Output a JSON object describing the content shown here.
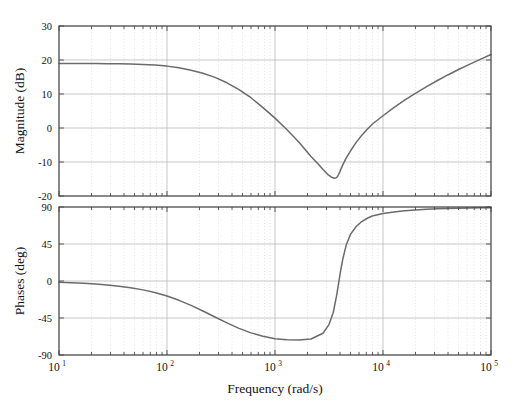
{
  "figure": {
    "title": "",
    "background_color": "#ffffff",
    "curve_color": "#6b6b6b",
    "frame_color": "#4a4a4a",
    "major_grid_color": "#b9b9b9",
    "minor_grid_color": "#d8d8d8"
  },
  "chart_data": [
    {
      "type": "line",
      "title": "",
      "panel": "magnitude",
      "xlabel": "Frequency (rad/s)",
      "ylabel": "Magnitude (dB)",
      "xscale": "log",
      "xlim": [
        10,
        100000
      ],
      "ylim": [
        -20,
        30
      ],
      "xticks": [
        10,
        100,
        1000,
        10000,
        100000
      ],
      "xticklabels": [
        "10^1",
        "10^2",
        "10^3",
        "10^4",
        "10^5"
      ],
      "yticks": [
        -20,
        -10,
        0,
        10,
        20,
        30
      ],
      "yticklabels": [
        "-20",
        "-10",
        "0",
        "10",
        "20",
        "30"
      ],
      "grid": true,
      "minor_grid": true,
      "legend": null,
      "series": [
        {
          "name": "Magnitude",
          "x": [
            10,
            13,
            17,
            22,
            28,
            36,
            46,
            60,
            77,
            100,
            129,
            167,
            215,
            278,
            359,
            464,
            599,
            774,
            1000,
            1292,
            1668,
            2154,
            2512,
            2783,
            3090,
            3311,
            3548,
            3715,
            3802,
            3890,
            3981,
            4074,
            4266,
            4571,
            5012,
            5623,
            6310,
            7079,
            7943,
            10000,
            12589,
            15849,
            19953,
            25119,
            31623,
            39811,
            50119,
            63096,
            79433,
            100000
          ],
          "y": [
            19.0,
            19.0,
            19.0,
            19.0,
            18.9,
            18.9,
            18.8,
            18.7,
            18.5,
            18.2,
            17.7,
            17.0,
            16.1,
            14.9,
            13.3,
            11.3,
            8.9,
            6.0,
            2.9,
            -0.5,
            -4.2,
            -8.4,
            -10.6,
            -12.2,
            -13.7,
            -14.4,
            -14.8,
            -14.6,
            -14.2,
            -13.6,
            -12.9,
            -12.1,
            -10.7,
            -8.8,
            -6.7,
            -4.3,
            -2.3,
            -0.5,
            1.1,
            3.6,
            6.0,
            8.2,
            10.2,
            12.1,
            13.9,
            15.6,
            17.2,
            18.7,
            20.2,
            21.6
          ]
        }
      ]
    },
    {
      "type": "line",
      "title": "",
      "panel": "phase",
      "xlabel": "Frequency (rad/s)",
      "ylabel": "Phases (deg)",
      "xscale": "log",
      "xlim": [
        10,
        100000
      ],
      "ylim": [
        -90,
        90
      ],
      "xticks": [
        10,
        100,
        1000,
        10000,
        100000
      ],
      "xticklabels": [
        "10^1",
        "10^2",
        "10^3",
        "10^4",
        "10^5"
      ],
      "yticks": [
        -90,
        -45,
        0,
        45,
        90
      ],
      "yticklabels": [
        "-90",
        "-45",
        "0",
        "45",
        "90"
      ],
      "grid": true,
      "minor_grid": true,
      "legend": null,
      "series": [
        {
          "name": "Phase",
          "x": [
            10,
            13,
            17,
            22,
            28,
            36,
            46,
            60,
            77,
            100,
            129,
            167,
            215,
            278,
            359,
            464,
            599,
            774,
            1000,
            1292,
            1668,
            2154,
            2783,
            3162,
            3467,
            3715,
            3890,
            4074,
            4266,
            4571,
            5012,
            5623,
            6310,
            7079,
            7943,
            10000,
            12589,
            15849,
            19953,
            25119,
            31623,
            39811,
            50119,
            63096,
            79433,
            100000
          ],
          "y": [
            -1.5,
            -2.0,
            -2.7,
            -3.6,
            -4.8,
            -6.3,
            -8.2,
            -10.8,
            -14.1,
            -18.3,
            -23.5,
            -29.6,
            -36.5,
            -43.8,
            -51.0,
            -57.6,
            -63.1,
            -67.3,
            -70.1,
            -71.6,
            -71.8,
            -70.5,
            -63.5,
            -53.0,
            -38.0,
            -18.0,
            -2.0,
            14.0,
            28.0,
            44.0,
            57.0,
            66.0,
            72.0,
            76.0,
            79.0,
            82.0,
            84.0,
            85.5,
            86.5,
            87.2,
            87.8,
            88.2,
            88.5,
            88.8,
            89.0,
            89.2
          ]
        }
      ]
    }
  ]
}
